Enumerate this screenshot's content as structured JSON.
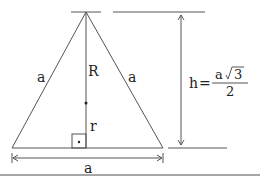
{
  "diagram": {
    "labels": {
      "side_left": "a",
      "side_right": "a",
      "base": "a",
      "circumradius": "R",
      "inradius": "r"
    },
    "formula": {
      "lhs": "h",
      "equals": "=",
      "numerator_var": "a",
      "numerator_root": "3",
      "denominator": "2"
    },
    "colors": {
      "stroke": "#555555",
      "text": "#222222"
    }
  }
}
